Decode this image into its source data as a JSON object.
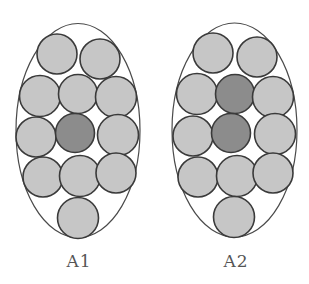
{
  "colors": {
    "light_fill": "#c6c6c6",
    "dark_fill": "#8c8c8c",
    "stroke": "#3a3a3a",
    "ellipse_stroke": "#4a4a4a"
  },
  "panels": [
    {
      "label": "A1",
      "ellipse": {
        "cx": 78,
        "cy": 130.5,
        "rx": 62,
        "ry": 107
      },
      "circles": [
        {
          "cx": 57,
          "cy": 54,
          "r": 20,
          "dark": false
        },
        {
          "cx": 100,
          "cy": 59,
          "r": 20,
          "dark": false
        },
        {
          "cx": 40,
          "cy": 96,
          "r": 20.5,
          "dark": false
        },
        {
          "cx": 78,
          "cy": 94,
          "r": 19.5,
          "dark": false
        },
        {
          "cx": 116,
          "cy": 97,
          "r": 20.5,
          "dark": false
        },
        {
          "cx": 36,
          "cy": 137,
          "r": 20,
          "dark": false
        },
        {
          "cx": 75,
          "cy": 133,
          "r": 19.5,
          "dark": true
        },
        {
          "cx": 118,
          "cy": 135,
          "r": 20.5,
          "dark": false
        },
        {
          "cx": 43,
          "cy": 177,
          "r": 20,
          "dark": false
        },
        {
          "cx": 80,
          "cy": 176,
          "r": 20.5,
          "dark": false
        },
        {
          "cx": 116,
          "cy": 173,
          "r": 20,
          "dark": false
        },
        {
          "cx": 78,
          "cy": 218,
          "r": 20.5,
          "dark": false
        }
      ]
    },
    {
      "label": "A2",
      "ellipse": {
        "cx": 234.5,
        "cy": 130,
        "rx": 62.5,
        "ry": 107
      },
      "circles": [
        {
          "cx": 213,
          "cy": 53,
          "r": 20,
          "dark": false
        },
        {
          "cx": 257,
          "cy": 57,
          "r": 20,
          "dark": false
        },
        {
          "cx": 197,
          "cy": 94,
          "r": 20.5,
          "dark": false
        },
        {
          "cx": 235,
          "cy": 94,
          "r": 19.5,
          "dark": true
        },
        {
          "cx": 273,
          "cy": 97,
          "r": 20.5,
          "dark": false
        },
        {
          "cx": 193,
          "cy": 136,
          "r": 20,
          "dark": false
        },
        {
          "cx": 231,
          "cy": 133,
          "r": 19.5,
          "dark": true
        },
        {
          "cx": 275,
          "cy": 134,
          "r": 20.5,
          "dark": false
        },
        {
          "cx": 198,
          "cy": 177,
          "r": 20,
          "dark": false
        },
        {
          "cx": 237,
          "cy": 176,
          "r": 20.5,
          "dark": false
        },
        {
          "cx": 273,
          "cy": 173,
          "r": 20,
          "dark": false
        },
        {
          "cx": 234,
          "cy": 217,
          "r": 20.5,
          "dark": false
        }
      ]
    }
  ]
}
